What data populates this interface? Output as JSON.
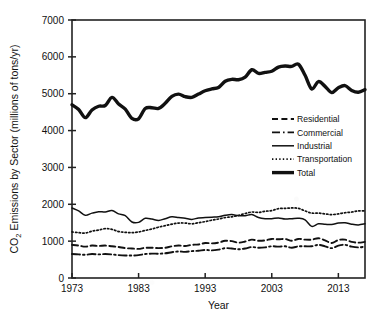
{
  "chart_data": {
    "type": "line",
    "title": "",
    "xlabel": "Year",
    "ylabel": "CO2 Emissions by Sector (millions of tons/yr)",
    "ylabel_parts": {
      "pre": "CO",
      "sub": "2",
      "post": " Emissions by Sector (millions of tons/yr)"
    },
    "xlim": [
      1973,
      2017
    ],
    "ylim": [
      0,
      7000
    ],
    "grid": false,
    "legend_position": "right-middle",
    "xticks": [
      1973,
      1983,
      1993,
      2003,
      2013
    ],
    "yticks": [
      0,
      1000,
      2000,
      3000,
      4000,
      5000,
      6000,
      7000
    ],
    "x": [
      1973,
      1974,
      1975,
      1976,
      1977,
      1978,
      1979,
      1980,
      1981,
      1982,
      1983,
      1984,
      1985,
      1986,
      1987,
      1988,
      1989,
      1990,
      1991,
      1992,
      1993,
      1994,
      1995,
      1996,
      1997,
      1998,
      1999,
      2000,
      2001,
      2002,
      2003,
      2004,
      2005,
      2006,
      2007,
      2008,
      2009,
      2010,
      2011,
      2012,
      2013,
      2014,
      2015,
      2016,
      2017
    ],
    "series": [
      {
        "name": "Residential",
        "style": "dashed",
        "values": [
          900,
          880,
          850,
          880,
          870,
          880,
          860,
          840,
          810,
          800,
          790,
          820,
          820,
          810,
          820,
          860,
          880,
          870,
          900,
          910,
          950,
          940,
          960,
          1010,
          1000,
          960,
          990,
          1040,
          1010,
          1020,
          1060,
          1050,
          1060,
          1010,
          1060,
          1040,
          1040,
          1080,
          1020,
          950,
          1030,
          1040,
          980,
          960,
          980
        ]
      },
      {
        "name": "Commercial",
        "style": "dashdot",
        "values": [
          650,
          640,
          630,
          650,
          640,
          650,
          640,
          620,
          610,
          610,
          620,
          650,
          660,
          660,
          670,
          700,
          720,
          710,
          730,
          740,
          760,
          750,
          770,
          810,
          800,
          780,
          800,
          840,
          820,
          830,
          860,
          850,
          860,
          820,
          860,
          860,
          860,
          900,
          860,
          810,
          880,
          900,
          850,
          830,
          850
        ]
      },
      {
        "name": "Industrial",
        "style": "solid-thin",
        "values": [
          1900,
          1820,
          1700,
          1760,
          1800,
          1790,
          1830,
          1740,
          1690,
          1520,
          1510,
          1620,
          1600,
          1560,
          1610,
          1660,
          1640,
          1620,
          1590,
          1630,
          1640,
          1650,
          1660,
          1700,
          1720,
          1690,
          1690,
          1720,
          1640,
          1610,
          1610,
          1630,
          1600,
          1610,
          1620,
          1580,
          1400,
          1470,
          1460,
          1450,
          1490,
          1500,
          1460,
          1440,
          1470
        ]
      },
      {
        "name": "Transportation",
        "style": "dotted",
        "values": [
          1250,
          1230,
          1220,
          1270,
          1300,
          1340,
          1320,
          1260,
          1240,
          1230,
          1250,
          1290,
          1330,
          1380,
          1420,
          1460,
          1490,
          1490,
          1470,
          1500,
          1530,
          1570,
          1600,
          1640,
          1660,
          1700,
          1750,
          1790,
          1780,
          1810,
          1830,
          1880,
          1890,
          1900,
          1890,
          1820,
          1760,
          1760,
          1740,
          1720,
          1740,
          1770,
          1790,
          1820,
          1820
        ]
      },
      {
        "name": "Total",
        "style": "solid-thick",
        "values": [
          4700,
          4570,
          4350,
          4560,
          4660,
          4680,
          4900,
          4720,
          4580,
          4330,
          4320,
          4600,
          4620,
          4600,
          4740,
          4930,
          4990,
          4920,
          4900,
          4990,
          5080,
          5130,
          5170,
          5340,
          5390,
          5380,
          5450,
          5650,
          5550,
          5580,
          5610,
          5720,
          5750,
          5740,
          5800,
          5500,
          5130,
          5330,
          5200,
          5030,
          5160,
          5220,
          5090,
          5040,
          5110
        ]
      }
    ],
    "legend_entries": [
      {
        "label": "Residential",
        "style": "dashed"
      },
      {
        "label": "Commercial",
        "style": "dashdot"
      },
      {
        "label": "Industrial",
        "style": "solid-thin"
      },
      {
        "label": "Transportation",
        "style": "dotted"
      },
      {
        "label": "Total",
        "style": "solid-thick"
      }
    ],
    "colors": {
      "line": "#111111",
      "axis": "#222222",
      "background": "#ffffff"
    }
  }
}
